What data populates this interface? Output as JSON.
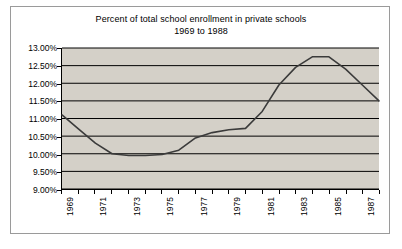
{
  "chart_data": {
    "type": "line",
    "title": "Percent of total school enrollment in private schools",
    "subtitle": "1969 to 1988",
    "xlabel": "",
    "ylabel": "",
    "grid": true,
    "legend": false,
    "ylim": [
      9.0,
      13.0
    ],
    "ytick_step": 0.5,
    "ytick_labels": [
      "13.00%",
      "12.50%",
      "12.00%",
      "11.50%",
      "11.00%",
      "10.50%",
      "10.00%",
      "9.50%",
      "9.00%"
    ],
    "ytick_values": [
      13.0,
      12.5,
      12.0,
      11.5,
      11.0,
      10.5,
      10.0,
      9.5,
      9.0
    ],
    "xlim": [
      1969,
      1988
    ],
    "xtick_labels": [
      "1969",
      "1971",
      "1973",
      "1975",
      "1977",
      "1979",
      "1981",
      "1983",
      "1985",
      "1987"
    ],
    "x": [
      1969,
      1970,
      1971,
      1972,
      1973,
      1974,
      1975,
      1976,
      1977,
      1978,
      1979,
      1980,
      1981,
      1982,
      1983,
      1984,
      1985,
      1986,
      1987,
      1988
    ],
    "values": [
      11.1,
      10.7,
      10.3,
      10.0,
      9.95,
      9.95,
      9.98,
      10.1,
      10.45,
      10.6,
      10.68,
      10.72,
      11.2,
      11.95,
      12.45,
      12.75,
      12.75,
      12.4,
      11.95,
      11.5
    ],
    "series": [
      {
        "name": "Percent in private schools",
        "color": "#3b3b3b",
        "values": [
          11.1,
          10.7,
          10.3,
          10.0,
          9.95,
          9.95,
          9.98,
          10.1,
          10.45,
          10.6,
          10.68,
          10.72,
          11.2,
          11.95,
          12.45,
          12.75,
          12.75,
          12.4,
          11.95,
          11.5
        ]
      }
    ],
    "plot_background": "#d4d0c8",
    "gridline_color": "#000000",
    "border_color": "#9a9a9a"
  }
}
